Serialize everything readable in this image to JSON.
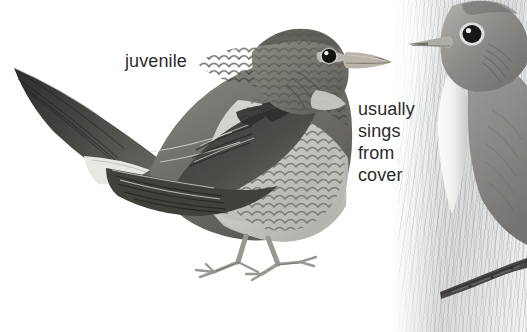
{
  "plate": {
    "title": "Juvenile songbird illustration plate",
    "width": 527,
    "height": 332,
    "background_color": "#ffffff",
    "text_color": "#2b2b2b"
  },
  "annotations": {
    "juvenile_label": "juvenile",
    "behavior_note": "usually\nsings\nfrom\ncover"
  },
  "subjects": [
    {
      "id": "juvenile-bird",
      "name": "juvenile bird perched facing right",
      "pose": "standing, head right, long pointed tail raised to upper left",
      "plumage": "grey-brown upperparts, scalloped scaly barring on breast and flanks, dark wing feathers with pale fringes",
      "bill": "pale pink-grey, dark tip",
      "eye": "large dark with white catchlight",
      "legs": "thin pale grey with long toes",
      "colors": {
        "upperparts": "#6f6f6d",
        "underparts": "#c9c7c2",
        "wing_dark": "#3b3b3a",
        "bill": "#b9b3aa",
        "eye": "#141414",
        "legs": "#9a9893"
      }
    },
    {
      "id": "adult-bird-cropped",
      "name": "second bird head and breast, cropped at right edge",
      "pose": "head facing left, body cut off by frame",
      "plumage": "grey-brown head, pale white throat and breast streak",
      "eye": "large dark with pale eyering",
      "colors": {
        "head": "#8d8b88",
        "throat": "#f3f3f2",
        "eye": "#171717",
        "eyering": "#e8e8e6"
      }
    }
  ],
  "scenery": {
    "background_wash": "soft vertical grey brushstroke wash on right third",
    "perch": "dark diagonal branch crossing lower right corner",
    "perch_color": "#4a4846"
  }
}
